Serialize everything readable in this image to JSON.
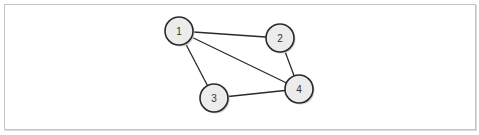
{
  "diagram": {
    "type": "undirected-graph",
    "nodes": [
      {
        "id": "1",
        "label": "1",
        "x": 179,
        "y": 31
      },
      {
        "id": "2",
        "label": "2",
        "x": 280,
        "y": 38
      },
      {
        "id": "3",
        "label": "3",
        "x": 214,
        "y": 98
      },
      {
        "id": "4",
        "label": "4",
        "x": 299,
        "y": 89
      }
    ],
    "edges": [
      {
        "from": "1",
        "to": "2"
      },
      {
        "from": "1",
        "to": "3"
      },
      {
        "from": "1",
        "to": "4"
      },
      {
        "from": "2",
        "to": "4"
      },
      {
        "from": "3",
        "to": "4"
      }
    ],
    "node_radius": 14,
    "colors": {
      "node_fill": "#ececec",
      "stroke": "#2a2a2a",
      "frame": "#c4c4c4"
    }
  }
}
